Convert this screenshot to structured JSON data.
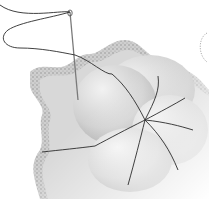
{
  "illustration": {
    "subject": "needle and thread stitching a gathered puff onto fabric",
    "colors": {
      "background": "#ffffff",
      "fabric": "#d9d9d9",
      "fabric_edge": "#bdbdbd",
      "puff_light": "#e6e6e6",
      "puff_dark": "#9a9a9a",
      "thread": "#2b2b2b",
      "needle": "#7a7a7a"
    }
  }
}
